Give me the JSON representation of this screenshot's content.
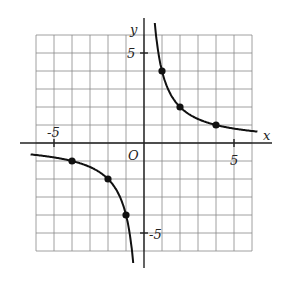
{
  "chart_data": {
    "type": "line",
    "title": "",
    "function": "y = 4/x",
    "xlabel": "x",
    "ylabel": "y",
    "origin_label": "O",
    "xlim": [
      -6,
      6
    ],
    "ylim": [
      -6,
      6
    ],
    "grid": true,
    "x_ticks_labeled": [
      -5,
      5
    ],
    "y_ticks_labeled": [
      5,
      -5
    ],
    "tick_labels": {
      "x_neg": "-5",
      "x_pos": "5",
      "y_pos": "5",
      "y_neg": "-5"
    },
    "points": [
      {
        "x": 1,
        "y": 4
      },
      {
        "x": 2,
        "y": 2
      },
      {
        "x": 4,
        "y": 1
      },
      {
        "x": -1,
        "y": -4
      },
      {
        "x": -2,
        "y": -2
      },
      {
        "x": -4,
        "y": -1
      }
    ],
    "series": [
      {
        "name": "branch-positive",
        "x_range": [
          0.6,
          6.3
        ]
      },
      {
        "name": "branch-negative",
        "x_range": [
          -6.3,
          -0.6
        ]
      }
    ]
  }
}
